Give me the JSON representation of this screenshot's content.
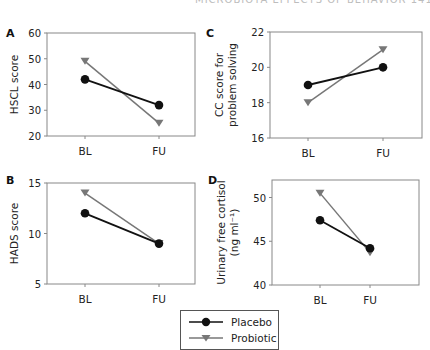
{
  "page": {
    "running_head": "MICROBIOTA EFFECTS OF BEHAVIOR 141"
  },
  "colors": {
    "placebo": "#111111",
    "probiotic": "#777777",
    "axis": "#888888",
    "text": "#222222"
  },
  "legend": {
    "items": [
      {
        "label": "Placebo",
        "marker": "circle"
      },
      {
        "label": "Probiotic",
        "marker": "triangle-down"
      }
    ]
  },
  "chart_data": [
    {
      "panel": "A",
      "type": "line",
      "title": "",
      "xlabel": "",
      "ylabel": "HSCL score",
      "categories": [
        "BL",
        "FU"
      ],
      "ylim": [
        20,
        60
      ],
      "yticks": [
        20,
        30,
        40,
        50,
        60
      ],
      "series": [
        {
          "name": "Placebo",
          "values": [
            42,
            32
          ]
        },
        {
          "name": "Probiotic",
          "values": [
            49,
            25
          ]
        }
      ]
    },
    {
      "panel": "B",
      "type": "line",
      "title": "",
      "xlabel": "",
      "ylabel": "HADS score",
      "categories": [
        "BL",
        "FU"
      ],
      "ylim": [
        5,
        15
      ],
      "yticks": [
        5,
        10,
        15
      ],
      "series": [
        {
          "name": "Placebo",
          "values": [
            12,
            9
          ]
        },
        {
          "name": "Probiotic",
          "values": [
            14,
            9
          ]
        }
      ]
    },
    {
      "panel": "C",
      "type": "line",
      "title": "",
      "xlabel": "",
      "ylabel": "CC score for problem solving",
      "ylabel_lines": [
        "CC score for",
        "problem solving"
      ],
      "categories": [
        "BL",
        "FU"
      ],
      "ylim": [
        16,
        22
      ],
      "yticks": [
        16,
        18,
        20,
        22
      ],
      "series": [
        {
          "name": "Placebo",
          "values": [
            19,
            20
          ]
        },
        {
          "name": "Probiotic",
          "values": [
            18,
            21
          ]
        }
      ]
    },
    {
      "panel": "D",
      "type": "line",
      "title": "",
      "xlabel": "",
      "ylabel": "Urinary free cortisol (ng ml-1)",
      "ylabel_lines": [
        "Urinary free cortisol",
        "(ng ml⁻¹)"
      ],
      "categories": [
        "BL",
        "FU"
      ],
      "ylim": [
        40,
        52
      ],
      "yticks": [
        40,
        45,
        50
      ],
      "series": [
        {
          "name": "Placebo",
          "values": [
            47.4,
            44.2
          ]
        },
        {
          "name": "Probiotic",
          "values": [
            50.5,
            43.7
          ]
        }
      ]
    }
  ]
}
